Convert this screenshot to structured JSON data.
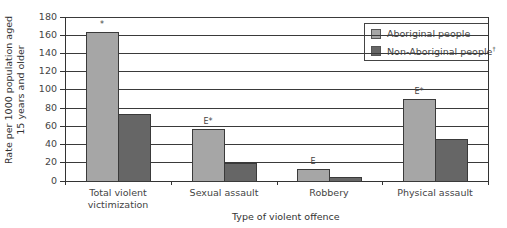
{
  "chart_data": {
    "type": "bar",
    "title": "",
    "xlabel": "Type of violent offence",
    "ylabel": "Rate per 1000 population aged 15 years and older",
    "ylabel_lines": [
      "Rate per 1000 population aged",
      "15 years and older"
    ],
    "ylim": [
      0,
      180
    ],
    "yticks": [
      0,
      20,
      40,
      60,
      80,
      100,
      120,
      140,
      160,
      180
    ],
    "grid": true,
    "legend_position": "top-right inside",
    "categories": [
      "Total violent victimization",
      "Sexual assault",
      "Robbery",
      "Physical assault"
    ],
    "category_lines": [
      [
        "Total violent",
        "victimization"
      ],
      [
        "Sexual assault"
      ],
      [
        "Robbery"
      ],
      [
        "Physical assault"
      ]
    ],
    "series": [
      {
        "name": "Aboriginal people",
        "color": "#a6a6a6",
        "values": [
          163,
          57,
          13,
          89
        ],
        "annotations": [
          "*",
          "E*",
          "E",
          "E*"
        ]
      },
      {
        "name": "Non-Aboriginal people",
        "name_superscript": "†",
        "color": "#666666",
        "values": [
          73,
          19,
          4,
          46
        ],
        "annotations": [
          "",
          "",
          "",
          ""
        ]
      }
    ]
  }
}
